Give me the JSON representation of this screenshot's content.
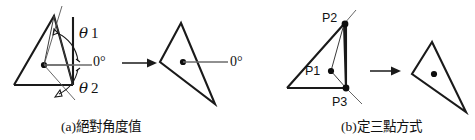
{
  "figure": {
    "background_color": "#ffffff",
    "ink_color": "#1a1a1a",
    "accent_thin_color": "#6b6b6b"
  },
  "panels": [
    {
      "id": "panel-a",
      "caption": "(a)絕對角度值",
      "caption_prefix": "(a)",
      "caption_body": "絕對角度值",
      "source_shape": {
        "name": "source-triangle-a",
        "description": "triangle with bounding box and center dot"
      },
      "angle_labels": {
        "theta1_symbol": "θ",
        "theta1_index": "1",
        "theta1_full": "θ1",
        "theta2_symbol": "θ",
        "theta2_index": "2",
        "theta2_full": "θ2",
        "zero_reference": "0°"
      },
      "transition_arrow": "→",
      "result_shape": {
        "name": "result-triangle-a",
        "zero_reference": "0°"
      }
    },
    {
      "id": "panel-b",
      "caption": "(b)定三點方式",
      "caption_prefix": "(b)",
      "caption_body": "定三點方式",
      "source_shape": {
        "name": "source-triangle-b",
        "description": "triangle defined by three marked points"
      },
      "point_labels": {
        "p1": "P1",
        "p2": "P2",
        "p3": "P3"
      },
      "transition_arrow": "→",
      "result_shape": {
        "name": "result-triangle-b"
      }
    }
  ]
}
